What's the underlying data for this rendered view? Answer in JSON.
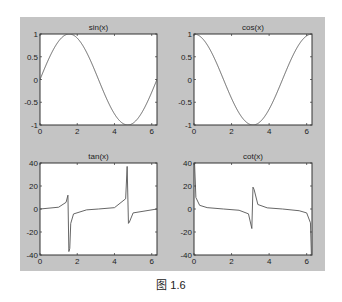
{
  "figure": {
    "caption": "图 1.6",
    "background_color": "#c4c4c4",
    "axes_background": "#ffffff",
    "line_color": "#555555"
  },
  "chart_data": [
    {
      "type": "line",
      "title": "sin(x)",
      "function": "sin",
      "xlabel": "",
      "ylabel": "",
      "xlim": [
        0,
        6.2832
      ],
      "ylim": [
        -1,
        1
      ],
      "xticks": [
        0,
        2,
        4,
        6
      ],
      "xtick_labels": [
        "0",
        "2",
        "4",
        "6"
      ],
      "yticks": [
        -1,
        -0.5,
        0,
        0.5,
        1
      ],
      "ytick_labels": [
        "-1",
        "-0.5",
        "0",
        "0.5",
        "1"
      ],
      "grid": false,
      "x": [
        0,
        0.5,
        1.0,
        1.5708,
        2.0,
        2.5,
        3.1416,
        3.5,
        4.0,
        4.7124,
        5.0,
        5.5,
        6.2832
      ],
      "y": [
        0,
        0.479,
        0.841,
        1.0,
        0.909,
        0.598,
        0,
        -0.351,
        -0.757,
        -1.0,
        -0.959,
        -0.706,
        0
      ],
      "box": {
        "left": 40,
        "top": 34,
        "right": 157,
        "bottom": 125
      }
    },
    {
      "type": "line",
      "title": "cos(x)",
      "function": "cos",
      "xlabel": "",
      "ylabel": "",
      "xlim": [
        0,
        6.2832
      ],
      "ylim": [
        -1,
        1
      ],
      "xticks": [
        0,
        2,
        4,
        6
      ],
      "xtick_labels": [
        "0",
        "2",
        "4",
        "6"
      ],
      "yticks": [
        -1,
        -0.5,
        0,
        0.5,
        1
      ],
      "ytick_labels": [
        "-1",
        "-0.5",
        "0",
        "0.5",
        "1"
      ],
      "grid": false,
      "x": [
        0,
        0.5,
        1.0,
        1.5708,
        2.0,
        2.5,
        3.1416,
        3.5,
        4.0,
        4.7124,
        5.0,
        5.5,
        6.2832
      ],
      "y": [
        1.0,
        0.878,
        0.54,
        0,
        -0.416,
        -0.801,
        -1.0,
        -0.936,
        -0.654,
        0,
        0.284,
        0.709,
        1.0
      ],
      "box": {
        "left": 194,
        "top": 34,
        "right": 312,
        "bottom": 125
      }
    },
    {
      "type": "line",
      "title": "tan(x)",
      "function": "tan",
      "xlabel": "",
      "ylabel": "",
      "xlim": [
        0,
        6.2832
      ],
      "ylim": [
        -40,
        40
      ],
      "xticks": [
        0,
        2,
        4,
        6
      ],
      "xtick_labels": [
        "0",
        "2",
        "4",
        "6"
      ],
      "yticks": [
        -40,
        -20,
        0,
        20,
        40
      ],
      "ytick_labels": [
        "-40",
        "-20",
        "0",
        "20",
        "40"
      ],
      "grid": false,
      "annotations": [
        "spike up ~12 then down ~-37 near x=1.57",
        "spike up ~37 then down ~-12 near x=4.71"
      ],
      "x": [
        0,
        1.0,
        1.4,
        1.5,
        1.55,
        1.6,
        1.65,
        1.8,
        2.5,
        3.1416,
        4.0,
        4.6,
        4.68,
        4.75,
        4.8,
        5.0,
        6.2832
      ],
      "y": [
        0,
        1.56,
        5.8,
        12.0,
        -37.0,
        -34.2,
        -12.6,
        -4.3,
        -0.75,
        0,
        1.16,
        8.9,
        37.0,
        -12.5,
        -11.4,
        -3.4,
        0
      ],
      "box": {
        "left": 40,
        "top": 163,
        "right": 157,
        "bottom": 255
      }
    },
    {
      "type": "line",
      "title": "cot(x)",
      "function": "cot",
      "xlabel": "",
      "ylabel": "",
      "xlim": [
        0,
        6.2832
      ],
      "ylim": [
        -40,
        40
      ],
      "xticks": [
        0,
        2,
        4,
        6
      ],
      "xtick_labels": [
        "0",
        "2",
        "4",
        "6"
      ],
      "yticks": [
        -40,
        -20,
        0,
        20,
        40
      ],
      "ytick_labels": [
        "-40",
        "-20",
        "0",
        "20",
        "40"
      ],
      "grid": false,
      "annotations": [
        "starts ~40 at x≈0",
        "spike down ~-17 then up ~19 near x=3.14",
        "drops to -40 near x=6.28"
      ],
      "x": [
        0.03,
        0.1,
        0.3,
        0.7,
        1.5708,
        2.4,
        2.9,
        3.08,
        3.14,
        3.2,
        3.4,
        3.9,
        4.7124,
        5.6,
        6.0,
        6.2,
        6.25
      ],
      "y": [
        40,
        10.0,
        3.2,
        1.19,
        0,
        -1.09,
        -4.2,
        -17.0,
        19.0,
        17.0,
        3.9,
        1.0,
        0,
        -1.5,
        -3.4,
        -12.0,
        -40
      ],
      "box": {
        "left": 194,
        "top": 163,
        "right": 312,
        "bottom": 255
      }
    }
  ]
}
